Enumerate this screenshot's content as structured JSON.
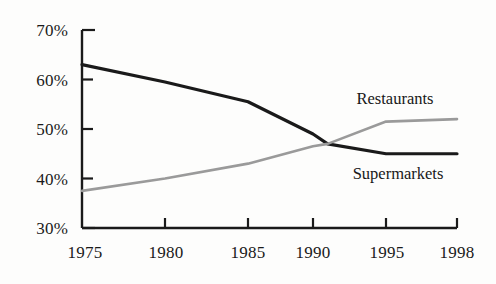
{
  "chart_data": {
    "type": "line",
    "title": "",
    "subtitle": "",
    "xlabel": "",
    "ylabel": "",
    "xlim": [
      1975,
      1998
    ],
    "ylim": [
      30,
      70
    ],
    "grid": false,
    "legend_position": "inline-annotations",
    "y_tick_labels": [
      "70%",
      "60%",
      "50%",
      "40%",
      "30%"
    ],
    "y_tick_values": [
      70,
      60,
      50,
      40,
      30
    ],
    "x_tick_labels": [
      "1975",
      "1980",
      "1985",
      "1990",
      "1995",
      "1998"
    ],
    "x_tick_values": [
      1975,
      1980,
      1985,
      1990,
      1995,
      1998
    ],
    "series": [
      {
        "name": "Supermarkets",
        "color": "#1a1a1a",
        "x": [
          1975,
          1980,
          1985,
          1990,
          1991,
          1995,
          1998
        ],
        "values": [
          63,
          59.5,
          55.5,
          49,
          47,
          45,
          45
        ]
      },
      {
        "name": "Restaurants",
        "color": "#9a9a9a",
        "x": [
          1975,
          1980,
          1985,
          1990,
          1991,
          1995,
          1998
        ],
        "values": [
          37.5,
          40,
          43,
          46.5,
          47,
          51.5,
          52
        ]
      }
    ],
    "annotations": [
      {
        "text": "Restaurants",
        "x": 1992.6,
        "y": 57.5
      },
      {
        "text": "Supermarkets",
        "x": 1993.2,
        "y": 42.2
      }
    ]
  },
  "axes": {
    "y_axis_name": "percent-share",
    "x_axis_name": "year"
  }
}
